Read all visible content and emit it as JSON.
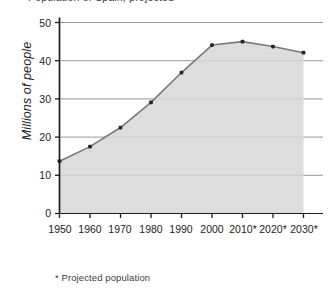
{
  "chart_data": {
    "type": "area",
    "title": "Population of Spain, projected",
    "xlabel": "",
    "ylabel": "Millions of people",
    "categories": [
      "1950",
      "1960",
      "1970",
      "1980",
      "1990",
      "2000",
      "2010*",
      "2020*",
      "2030*"
    ],
    "x": [
      1950,
      1960,
      1970,
      1980,
      1990,
      2000,
      2010,
      2020,
      2030
    ],
    "values": [
      13.7,
      17.5,
      22.5,
      29.1,
      36.9,
      44.1,
      45.0,
      43.7,
      42.1
    ],
    "series": [
      {
        "name": "Millions of people",
        "values": [
          13.7,
          17.5,
          22.5,
          29.1,
          36.9,
          44.1,
          45.0,
          43.7,
          42.1
        ]
      }
    ],
    "ylim": [
      0,
      50
    ],
    "yticks": [
      0,
      10,
      20,
      30,
      40,
      50
    ],
    "ytick_labels": [
      "0",
      "10",
      "20",
      "30",
      "40",
      "50"
    ],
    "grid": "horizontal",
    "legend": "none",
    "fill_color": "#d7d7d7",
    "line_color": "#7a7a7a",
    "marker_color": "#262626",
    "grid_color": "#8c8c8c",
    "axis_color": "#1d1d1d",
    "footnote": "* Projected population",
    "annotations": [
      "Asterisked years (2010*, 2020*, 2030*) are projected values"
    ]
  }
}
